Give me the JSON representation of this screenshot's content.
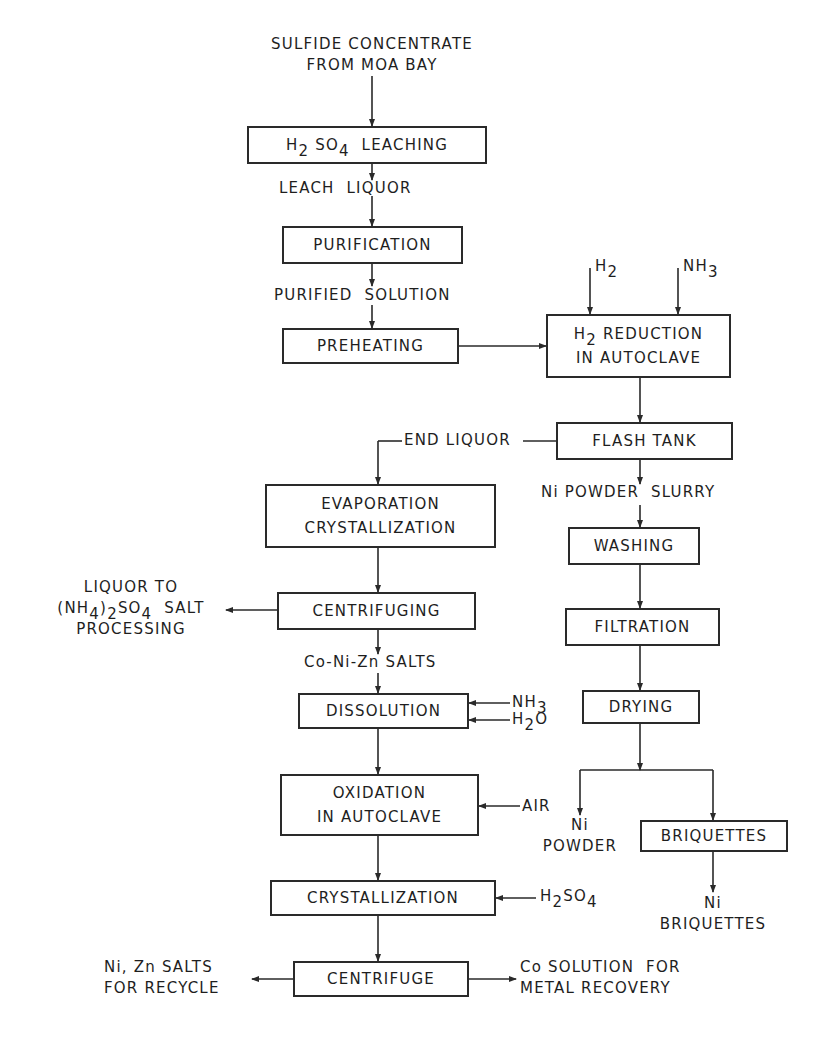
{
  "diagram": {
    "type": "process-flowchart",
    "source": {
      "line1": "SULFIDE CONCENTRATE",
      "line2": "FROM MOA BAY"
    },
    "nodes": {
      "leaching": {
        "pre": "H",
        "sub1": "2",
        "mid": " SO",
        "sub2": "4",
        "post": "  LEACHING"
      },
      "purification": {
        "label": "PURIFICATION"
      },
      "preheating": {
        "label": "PREHEATING"
      },
      "reduction": {
        "line1_pre": "H",
        "line1_sub": "2",
        "line1_post": " REDUCTION",
        "line2": "IN AUTOCLAVE"
      },
      "flash_tank": {
        "label": "FLASH TANK"
      },
      "evaporation": {
        "line1": "EVAPORATION",
        "line2": "CRYSTALLIZATION"
      },
      "washing": {
        "label": "WASHING"
      },
      "filtration": {
        "label": "FILTRATION"
      },
      "centrifuging": {
        "label": "CENTRIFUGING"
      },
      "drying": {
        "label": "DRYING"
      },
      "dissolution": {
        "label": "DISSOLUTION"
      },
      "oxidation": {
        "line1": "OXIDATION",
        "line2": "IN AUTOCLAVE"
      },
      "briquettes": {
        "label": "BRIQUETTES"
      },
      "crystallization": {
        "label": "CRYSTALLIZATION"
      },
      "centrifuge": {
        "label": "CENTRIFUGE"
      }
    },
    "streams": {
      "leach_liquor": "LEACH  LIQUOR",
      "purified_solution": "PURIFIED  SOLUTION",
      "h2_input": {
        "pre": "H",
        "sub": "2"
      },
      "nh3_input": {
        "pre": "NH",
        "sub": "3"
      },
      "end_liquor": "END LIQUOR",
      "ni_powder_slurry": "Ni POWDER  SLURRY",
      "liquor_to": {
        "line1": "LIQUOR TO",
        "line2_a": "(NH",
        "line2_sub1": "4",
        "line2_b": ")",
        "line2_sub2": "2",
        "line2_c": "SO",
        "line2_sub3": "4",
        "line2_d": "  SALT",
        "line3": "PROCESSING"
      },
      "co_ni_zn_salts": "Co-Ni-Zn SALTS",
      "dissolution_nh3": {
        "pre": "NH",
        "sub": "3"
      },
      "dissolution_h2o": {
        "pre": "H",
        "sub": "2",
        "post": "O"
      },
      "air": "AIR",
      "ni_powder": {
        "line1": "Ni",
        "line2": "POWDER"
      },
      "ni_briquettes": {
        "line1": "Ni",
        "line2": "BRIQUETTES"
      },
      "h2so4_input": {
        "pre": "H",
        "sub1": "2",
        "mid": "SO",
        "sub2": "4"
      },
      "ni_zn_salts": {
        "line1": "Ni, Zn SALTS",
        "line2": "FOR RECYCLE"
      },
      "co_solution": {
        "line1": "Co SOLUTION  FOR",
        "line2": "METAL RECOVERY"
      }
    },
    "colors": {
      "line": "#2a2a2a",
      "background": "#ffffff"
    }
  }
}
